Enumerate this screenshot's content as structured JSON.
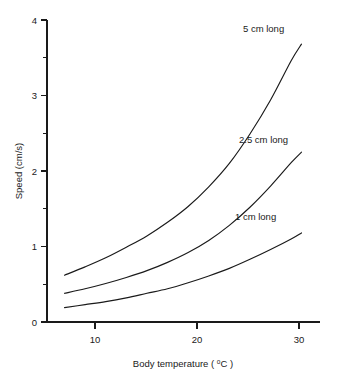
{
  "chart_data": {
    "type": "line",
    "title": "",
    "xlabel": "Body temperature ( °C )",
    "ylabel": "Speed (cm/s)",
    "xlim": [
      5.3,
      31.8
    ],
    "ylim": [
      0,
      4
    ],
    "grid": false,
    "legend_position": "inline-labels",
    "x_ticks": [
      10,
      20,
      30
    ],
    "x_tick_labels": [
      "10",
      "20",
      "30"
    ],
    "y_ticks": [
      0,
      1,
      2,
      3,
      4
    ],
    "y_tick_labels": [
      "0",
      "1",
      "2",
      "3",
      "4"
    ],
    "y_minor_ticks": [
      0.5,
      1.5,
      2.5,
      3.5
    ],
    "x": [
      7,
      9,
      11,
      13,
      15,
      17,
      19,
      21,
      23,
      25,
      27,
      29,
      30
    ],
    "series": [
      {
        "name": "5 cm long",
        "label": "5 cm long",
        "color": "#1a1a1a",
        "values": [
          0.62,
          0.73,
          0.85,
          0.99,
          1.14,
          1.32,
          1.53,
          1.79,
          2.1,
          2.49,
          2.94,
          3.46,
          3.68
        ]
      },
      {
        "name": "2.5 cm long",
        "label": "2.5 cm long",
        "color": "#1a1a1a",
        "values": [
          0.38,
          0.44,
          0.51,
          0.59,
          0.68,
          0.79,
          0.92,
          1.08,
          1.28,
          1.52,
          1.8,
          2.11,
          2.25
        ]
      },
      {
        "name": "1 cm long",
        "label": "1 cm long",
        "color": "#1a1a1a",
        "values": [
          0.19,
          0.23,
          0.27,
          0.32,
          0.38,
          0.44,
          0.52,
          0.61,
          0.71,
          0.83,
          0.96,
          1.1,
          1.18
        ]
      }
    ],
    "annotations": [
      {
        "text": "5 cm long",
        "x": 26.4,
        "y": 3.88
      },
      {
        "text": "2.5 cm long",
        "x": 26.0,
        "y": 2.42
      },
      {
        "text": "1 cm long",
        "x": 25.6,
        "y": 1.4
      }
    ]
  },
  "axis": {
    "x_title": "Body temperature ( °C )",
    "x_title_prefix": "Body temperature ( ",
    "x_title_degree": "o",
    "x_title_suffix": "C )",
    "y_title": "Speed (cm/s)"
  },
  "colors": {
    "background": "#ffffff",
    "ink": "#1a1a1a",
    "curve": "#1a1a1a"
  }
}
